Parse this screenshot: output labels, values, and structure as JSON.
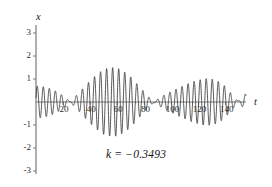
{
  "figure": {
    "background": "#ffffff",
    "curve_color": "#3a3a3a",
    "axis_color": "#6e6e6e"
  },
  "axes": {
    "x_axis_name": "t",
    "y_axis_name": "x"
  },
  "annotation": {
    "k_text": "k = −0.3493"
  },
  "chart_data": {
    "type": "line",
    "title": "",
    "subtitle": "",
    "xlabel": "t",
    "ylabel": "x",
    "xlim": [
      0,
      155
    ],
    "ylim": [
      -3,
      3
    ],
    "grid": false,
    "legend": null,
    "annotations": [
      {
        "text": "k = −0.3493",
        "x": 75,
        "y": -2
      }
    ],
    "xticks": [
      20,
      40,
      60,
      80,
      100,
      120,
      140
    ],
    "xticklabels": [
      "20",
      "40",
      "60",
      "80",
      "100",
      "120",
      "140"
    ],
    "yticks": [
      -3,
      -2,
      -1,
      1,
      2,
      3
    ],
    "yticklabels": [
      "-3",
      "-2",
      "-1",
      "1",
      "2",
      "3"
    ],
    "series": [
      {
        "name": "x(t)",
        "model": "0.78*sin(2*pi*t/4.62) + 0.72*sin(2*pi*t/4.30 + 0.6)",
        "components": [
          {
            "amplitude": 0.78,
            "period": 4.62,
            "phase": 0.0
          },
          {
            "amplitude": 0.72,
            "period": 4.3,
            "phase": 0.6
          }
        ],
        "envelope_samples": [
          {
            "t": 0,
            "amp": 0.72
          },
          {
            "t": 10,
            "amp": 0.85
          },
          {
            "t": 20,
            "amp": 1.02
          },
          {
            "t": 30,
            "amp": 1.2
          },
          {
            "t": 40,
            "amp": 1.35
          },
          {
            "t": 50,
            "amp": 1.48
          },
          {
            "t": 60,
            "amp": 1.5
          },
          {
            "t": 70,
            "amp": 1.42
          },
          {
            "t": 80,
            "amp": 1.2
          },
          {
            "t": 90,
            "amp": 0.9
          },
          {
            "t": 100,
            "amp": 0.75
          },
          {
            "t": 110,
            "amp": 0.8
          },
          {
            "t": 120,
            "amp": 0.95
          },
          {
            "t": 130,
            "amp": 1.2
          },
          {
            "t": 140,
            "amp": 1.45
          },
          {
            "t": 150,
            "amp": 1.3
          }
        ]
      }
    ]
  },
  "tick_labels": {
    "y": [
      {
        "text": "3",
        "value": 3
      },
      {
        "text": "2",
        "value": 2
      },
      {
        "text": "1",
        "value": 1
      },
      {
        "text": "-1",
        "value": -1
      },
      {
        "text": "-2",
        "value": -2
      },
      {
        "text": "-3",
        "value": -3
      }
    ],
    "x": [
      {
        "text": "20",
        "value": 20
      },
      {
        "text": "40",
        "value": 40
      },
      {
        "text": "60",
        "value": 60
      },
      {
        "text": "80",
        "value": 80
      },
      {
        "text": "100",
        "value": 100
      },
      {
        "text": "120",
        "value": 120
      },
      {
        "text": "140",
        "value": 140
      }
    ]
  }
}
